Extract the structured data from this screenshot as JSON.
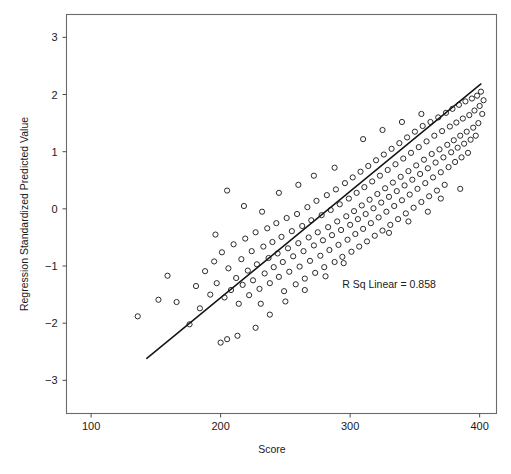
{
  "chart_data": {
    "type": "scatter",
    "title": "",
    "xlabel": "Score",
    "ylabel": "Regression Standardized Predicted Value",
    "xlim": [
      81,
      413
    ],
    "ylim": [
      -3.58,
      3.4
    ],
    "xticks": [
      100,
      200,
      300,
      400
    ],
    "xtick_labels": [
      "100",
      "200",
      "300",
      "400"
    ],
    "yticks": [
      3,
      2,
      1,
      0,
      -1,
      -2,
      -3
    ],
    "ytick_labels": [
      "3",
      "2",
      "1",
      "0",
      "−1",
      "−2",
      "−3"
    ],
    "grid": false,
    "legend": null,
    "annotations": [
      {
        "text": "R Sq Linear = 0.858",
        "x": 330,
        "y": -1.39
      }
    ],
    "fit_line": {
      "type": "linear",
      "r_squared": 0.858,
      "x_start": 143,
      "y_start": -2.615,
      "x_end": 401,
      "y_end": 2.185
    },
    "marker_style": "open-circle",
    "n_points": 208,
    "points": [
      [
        136,
        -1.88
      ],
      [
        152,
        -1.59
      ],
      [
        159,
        -1.17
      ],
      [
        166,
        -1.63
      ],
      [
        176,
        -2.02
      ],
      [
        181,
        -1.35
      ],
      [
        184,
        -1.74
      ],
      [
        188,
        -1.09
      ],
      [
        192,
        -1.5
      ],
      [
        195,
        -0.92
      ],
      [
        197,
        -1.3
      ],
      [
        200,
        -2.34
      ],
      [
        201,
        -0.76
      ],
      [
        203,
        -1.55
      ],
      [
        205,
        -2.28
      ],
      [
        206,
        -1.04
      ],
      [
        208,
        -1.42
      ],
      [
        210,
        -0.62
      ],
      [
        212,
        -1.21
      ],
      [
        214,
        -1.66
      ],
      [
        216,
        -0.88
      ],
      [
        217,
        -1.33
      ],
      [
        219,
        -0.52
      ],
      [
        221,
        -1.08
      ],
      [
        222,
        -1.51
      ],
      [
        224,
        -0.74
      ],
      [
        225,
        -1.25
      ],
      [
        227,
        -0.41
      ],
      [
        228,
        -0.97
      ],
      [
        230,
        -1.4
      ],
      [
        231,
        -1.66
      ],
      [
        233,
        -0.66
      ],
      [
        234,
        -1.13
      ],
      [
        236,
        -0.34
      ],
      [
        237,
        -0.86
      ],
      [
        238,
        -1.3
      ],
      [
        240,
        -0.58
      ],
      [
        241,
        -1.02
      ],
      [
        243,
        -0.25
      ],
      [
        244,
        -0.78
      ],
      [
        245,
        -1.19
      ],
      [
        247,
        -0.49
      ],
      [
        248,
        -0.93
      ],
      [
        249,
        -1.44
      ],
      [
        251,
        -0.16
      ],
      [
        252,
        -0.69
      ],
      [
        253,
        -1.1
      ],
      [
        255,
        -0.39
      ],
      [
        256,
        -0.83
      ],
      [
        258,
        -1.32
      ],
      [
        259,
        -0.09
      ],
      [
        260,
        -0.6
      ],
      [
        261,
        -1.01
      ],
      [
        263,
        -0.3
      ],
      [
        264,
        -0.74
      ],
      [
        265,
        -1.22
      ],
      [
        267,
        0.03
      ],
      [
        268,
        -0.5
      ],
      [
        269,
        -0.91
      ],
      [
        270,
        -0.2
      ],
      [
        272,
        -0.64
      ],
      [
        273,
        -1.12
      ],
      [
        274,
        0.14
      ],
      [
        275,
        -0.41
      ],
      [
        277,
        -0.82
      ],
      [
        278,
        -0.11
      ],
      [
        279,
        -0.55
      ],
      [
        280,
        -1.02
      ],
      [
        282,
        0.24
      ],
      [
        283,
        -0.32
      ],
      [
        284,
        -0.72
      ],
      [
        285,
        -0.02
      ],
      [
        286,
        -0.46
      ],
      [
        288,
        -0.93
      ],
      [
        289,
        0.34
      ],
      [
        290,
        -0.22
      ],
      [
        291,
        -0.63
      ],
      [
        292,
        0.08
      ],
      [
        293,
        -0.37
      ],
      [
        294,
        -0.84
      ],
      [
        296,
        0.45
      ],
      [
        297,
        -0.13
      ],
      [
        298,
        -0.54
      ],
      [
        299,
        0.18
      ],
      [
        300,
        -0.28
      ],
      [
        301,
        -0.75
      ],
      [
        302,
        0.55
      ],
      [
        303,
        -0.04
      ],
      [
        304,
        -0.44
      ],
      [
        305,
        0.28
      ],
      [
        306,
        -0.18
      ],
      [
        307,
        -0.66
      ],
      [
        308,
        0.65
      ],
      [
        309,
        0.06
      ],
      [
        310,
        -0.35
      ],
      [
        311,
        0.38
      ],
      [
        312,
        -0.09
      ],
      [
        313,
        -0.57
      ],
      [
        314,
        0.75
      ],
      [
        315,
        0.16
      ],
      [
        316,
        -0.25
      ],
      [
        317,
        0.48
      ],
      [
        318,
        0.01
      ],
      [
        319,
        -0.47
      ],
      [
        320,
        0.85
      ],
      [
        321,
        0.26
      ],
      [
        322,
        -0.15
      ],
      [
        323,
        0.58
      ],
      [
        324,
        0.11
      ],
      [
        325,
        -0.38
      ],
      [
        326,
        0.95
      ],
      [
        327,
        0.36
      ],
      [
        328,
        -0.05
      ],
      [
        329,
        0.68
      ],
      [
        330,
        0.21
      ],
      [
        331,
        -0.28
      ],
      [
        332,
        1.05
      ],
      [
        333,
        0.46
      ],
      [
        334,
        0.05
      ],
      [
        335,
        0.78
      ],
      [
        336,
        0.31
      ],
      [
        337,
        -0.18
      ],
      [
        338,
        1.15
      ],
      [
        339,
        0.56
      ],
      [
        340,
        0.15
      ],
      [
        341,
        0.88
      ],
      [
        342,
        0.41
      ],
      [
        343,
        -0.08
      ],
      [
        344,
        1.25
      ],
      [
        345,
        0.66
      ],
      [
        346,
        0.25
      ],
      [
        347,
        0.98
      ],
      [
        348,
        0.51
      ],
      [
        349,
        0.02
      ],
      [
        350,
        1.35
      ],
      [
        351,
        0.76
      ],
      [
        352,
        0.35
      ],
      [
        353,
        1.08
      ],
      [
        354,
        0.61
      ],
      [
        355,
        0.12
      ],
      [
        356,
        1.45
      ],
      [
        357,
        0.86
      ],
      [
        358,
        0.45
      ],
      [
        359,
        1.18
      ],
      [
        360,
        0.71
      ],
      [
        361,
        0.22
      ],
      [
        362,
        1.52
      ],
      [
        363,
        0.96
      ],
      [
        364,
        0.55
      ],
      [
        365,
        1.28
      ],
      [
        366,
        0.81
      ],
      [
        367,
        0.32
      ],
      [
        368,
        1.6
      ],
      [
        369,
        1.04
      ],
      [
        370,
        0.64
      ],
      [
        371,
        1.36
      ],
      [
        372,
        0.9
      ],
      [
        373,
        0.42
      ],
      [
        374,
        1.68
      ],
      [
        375,
        1.12
      ],
      [
        376,
        0.73
      ],
      [
        377,
        1.44
      ],
      [
        378,
        0.99
      ],
      [
        379,
        1.75
      ],
      [
        380,
        1.2
      ],
      [
        381,
        0.82
      ],
      [
        382,
        1.51
      ],
      [
        383,
        1.07
      ],
      [
        384,
        1.82
      ],
      [
        385,
        1.28
      ],
      [
        386,
        0.9
      ],
      [
        387,
        1.58
      ],
      [
        388,
        1.14
      ],
      [
        389,
        1.88
      ],
      [
        390,
        1.35
      ],
      [
        391,
        0.98
      ],
      [
        392,
        1.64
      ],
      [
        393,
        1.21
      ],
      [
        394,
        1.93
      ],
      [
        395,
        1.42
      ],
      [
        396,
        1.72
      ],
      [
        397,
        1.28
      ],
      [
        398,
        1.98
      ],
      [
        399,
        1.5
      ],
      [
        400,
        1.8
      ],
      [
        401,
        2.05
      ],
      [
        402,
        1.66
      ],
      [
        403,
        1.9
      ],
      [
        245,
        0.28
      ],
      [
        260,
        0.42
      ],
      [
        272,
        0.58
      ],
      [
        288,
        0.72
      ],
      [
        218,
        0.05
      ],
      [
        232,
        -0.05
      ],
      [
        205,
        0.32
      ],
      [
        196,
        -0.45
      ],
      [
        310,
        1.22
      ],
      [
        325,
        1.38
      ],
      [
        340,
        1.52
      ],
      [
        355,
        1.66
      ],
      [
        370,
        0.18
      ],
      [
        385,
        0.35
      ],
      [
        295,
        -0.95
      ],
      [
        281,
        -1.18
      ],
      [
        265,
        -1.42
      ],
      [
        250,
        -1.62
      ],
      [
        238,
        -1.85
      ],
      [
        227,
        -2.08
      ],
      [
        213,
        -2.22
      ],
      [
        345,
        -0.22
      ],
      [
        360,
        -0.05
      ],
      [
        330,
        -0.42
      ]
    ]
  },
  "figure": {
    "background_color": "#ffffff",
    "frame_color": "#6b6b6b",
    "marker_color": "#2b2b2b",
    "line_color": "#141414"
  }
}
